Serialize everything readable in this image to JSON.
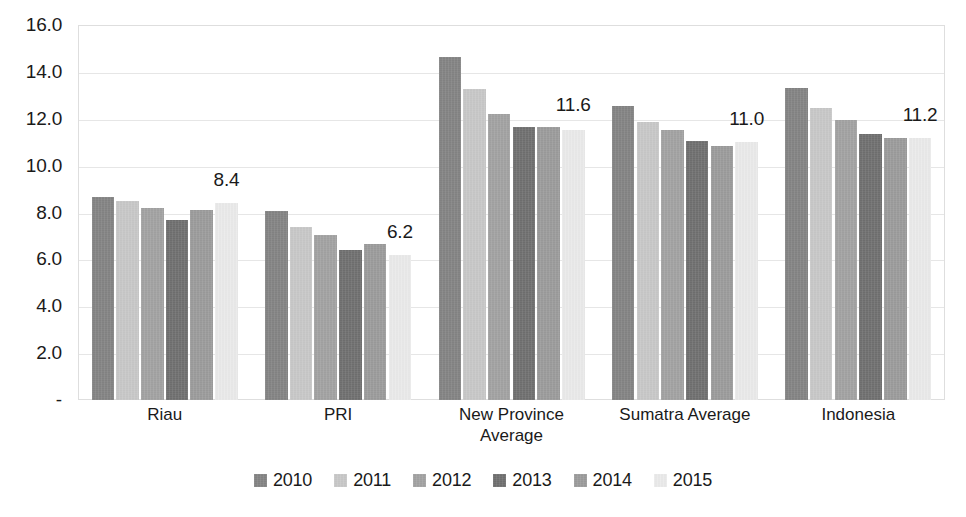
{
  "chart_data": {
    "type": "bar",
    "title": "",
    "subtitle": "",
    "xlabel": "",
    "ylabel": "",
    "ylim": [
      0,
      16
    ],
    "grid": true,
    "legend_position": "bottom",
    "y_ticks": [
      "-",
      "2.0",
      "4.0",
      "6.0",
      "8.0",
      "10.0",
      "12.0",
      "14.0",
      "16.0"
    ],
    "y_tick_values": [
      0,
      2,
      4,
      6,
      8,
      10,
      12,
      14,
      16
    ],
    "categories": [
      "Riau",
      "PRI",
      "New Province Average",
      "Sumatra Average",
      "Indonesia"
    ],
    "series": [
      {
        "name": "2010",
        "color": "#848484",
        "values": [
          8.65,
          8.05,
          14.65,
          12.55,
          13.3
        ]
      },
      {
        "name": "2011",
        "color": "#c9c9c9",
        "values": [
          8.5,
          7.4,
          13.25,
          11.85,
          12.45
        ]
      },
      {
        "name": "2012",
        "color": "#a3a3a3",
        "values": [
          8.2,
          7.05,
          12.2,
          11.5,
          11.95
        ]
      },
      {
        "name": "2013",
        "color": "#707070",
        "values": [
          7.7,
          6.4,
          11.65,
          11.05,
          11.35
        ]
      },
      {
        "name": "2014",
        "color": "#9c9c9c",
        "values": [
          8.1,
          6.65,
          11.65,
          10.85,
          11.2
        ]
      },
      {
        "name": "2015",
        "color": "#ececec",
        "values": [
          8.4,
          6.2,
          11.5,
          11.0,
          11.2
        ]
      }
    ],
    "data_labels": [
      {
        "category": "Riau",
        "series": "2015",
        "text": "8.4",
        "value": 8.4
      },
      {
        "category": "PRI",
        "series": "2015",
        "text": "6.2",
        "value": 6.2
      },
      {
        "category": "New Province Average",
        "series": "2015",
        "text": "11.6",
        "value": 11.6
      },
      {
        "category": "Sumatra Average",
        "series": "2015",
        "text": "11.0",
        "value": 11.0
      },
      {
        "category": "Indonesia",
        "series": "2015",
        "text": "11.2",
        "value": 11.2
      }
    ]
  }
}
